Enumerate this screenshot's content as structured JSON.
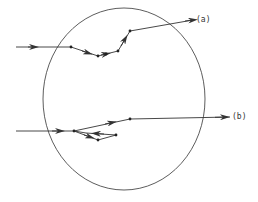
{
  "diagram": {
    "type": "particle-trajectories-through-sphere",
    "colors": {
      "stroke": "#333333",
      "background": "#ffffff"
    },
    "circle": {
      "cx": 124,
      "cy": 99,
      "rx": 81,
      "ry": 91
    },
    "paths": [
      {
        "id": "a",
        "label": "(a)",
        "points": [
          [
            16,
            47
          ],
          [
            71,
            47
          ],
          [
            98,
            56
          ],
          [
            106,
            54
          ],
          [
            118,
            51
          ],
          [
            130,
            31
          ],
          [
            193,
            20
          ]
        ],
        "dots": [
          [
            71,
            47
          ],
          [
            98,
            56
          ],
          [
            106,
            54
          ],
          [
            118,
            51
          ],
          [
            130,
            31
          ]
        ]
      },
      {
        "id": "b",
        "label": "(b)",
        "points": [
          [
            16,
            131
          ],
          [
            74,
            131
          ],
          [
            98,
            140
          ],
          [
            116,
            135
          ],
          [
            86,
            133
          ],
          [
            74,
            131
          ],
          [
            130,
            119
          ],
          [
            230,
            117
          ]
        ],
        "dots": [
          [
            74,
            131
          ],
          [
            98,
            140
          ],
          [
            116,
            135
          ],
          [
            130,
            119
          ]
        ]
      }
    ]
  },
  "labels": {
    "a": "(a)",
    "b": "(b)"
  }
}
